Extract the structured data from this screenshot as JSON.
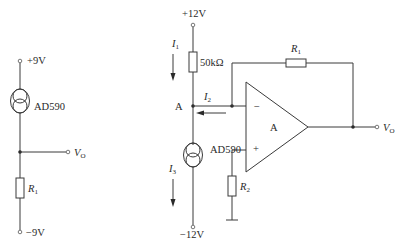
{
  "left_circuit": {
    "supply_top": "+9V",
    "supply_bottom": "−9V",
    "sensor_label": "AD590",
    "resistor": {
      "symbol": "R",
      "sub": "1"
    },
    "output": {
      "symbol": "V",
      "sub": "O"
    }
  },
  "right_circuit": {
    "supply_top": "+12V",
    "supply_bottom": "−12V",
    "resistor_top": "50kΩ",
    "node_label": "A",
    "sensor_label": "AD590",
    "opamp_label": "A",
    "opamp_minus": "−",
    "opamp_plus": "+",
    "feedback_resistor": {
      "symbol": "R",
      "sub": "1"
    },
    "bias_resistor": {
      "symbol": "R",
      "sub": "2"
    },
    "currents": [
      {
        "symbol": "I",
        "sub": "1"
      },
      {
        "symbol": "I",
        "sub": "2"
      },
      {
        "symbol": "I",
        "sub": "3"
      }
    ],
    "output": {
      "symbol": "V",
      "sub": "O"
    }
  }
}
